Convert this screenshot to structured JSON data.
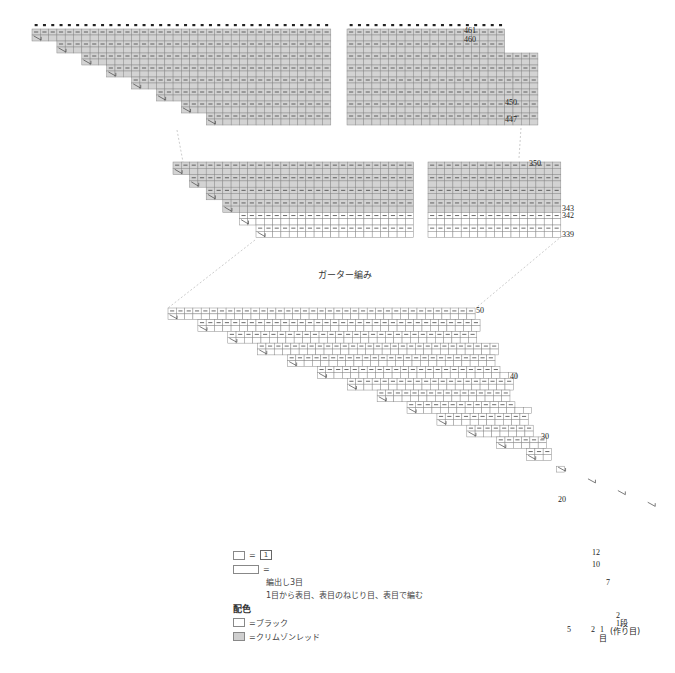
{
  "title": "ガーター編み",
  "colors": {
    "black_yarn": "#ffffff",
    "crimson_red": "#d3d3d3",
    "grid": "#8a8a8a",
    "outline": "#333333"
  },
  "charts": [
    {
      "name": "top-left",
      "x": 32,
      "y": 29,
      "cols": 36,
      "rows": 16,
      "cell_w": 8.3,
      "cell_h": 6,
      "fill": "gray",
      "steps": 8,
      "step_cols": 3,
      "rows_per_step": 2,
      "top_dots": true
    },
    {
      "name": "top-right",
      "x": 347,
      "y": 29,
      "cols": 19,
      "rows": 16,
      "cell_w": 8.3,
      "cell_h": 6,
      "fill": "gray",
      "right_steps": [
        {
          "row": 11,
          "cols": 2
        },
        {
          "row": 4,
          "cols": 2
        }
      ],
      "top_dots": true
    },
    {
      "name": "mid-left",
      "x": 173,
      "y": 162,
      "cols": 29,
      "rows": 12,
      "cell_w": 8.3,
      "cell_h": 6.3,
      "fill": "gray",
      "white_rows": 4,
      "steps": 6,
      "step_cols": 2
    },
    {
      "name": "mid-right",
      "x": 428,
      "y": 162,
      "cols": 16,
      "rows": 12,
      "cell_w": 8.3,
      "cell_h": 6.3,
      "fill": "gray",
      "white_rows": 4
    }
  ],
  "row_labels": {
    "top_right": [
      "461",
      "460",
      "450",
      "447"
    ],
    "mid_right": [
      "350",
      "343",
      "342",
      "339"
    ],
    "bottom": [
      "50",
      "40",
      "30",
      "20",
      "12",
      "10",
      "7",
      "2",
      "1段"
    ]
  },
  "bottom_chart": {
    "x": 168,
    "y": 308,
    "rows": 50,
    "cell_w": 8.3,
    "cell_h": 5.86,
    "top_cols": 37,
    "step_cols": 6
  },
  "bottom_labels": {
    "col_labels": [
      "5",
      "2",
      "1"
    ],
    "col_unit": "目",
    "cast_on": "(作り目)"
  },
  "legend": {
    "knit_symbol_label": "1",
    "increase_label": "編出し3目",
    "increase_desc": "1目から表目、表目のねじり目、表目で編む",
    "color_heading": "配色",
    "white_label": "=ブラック",
    "gray_label": "=クリムゾンレッド",
    "equals": "="
  }
}
